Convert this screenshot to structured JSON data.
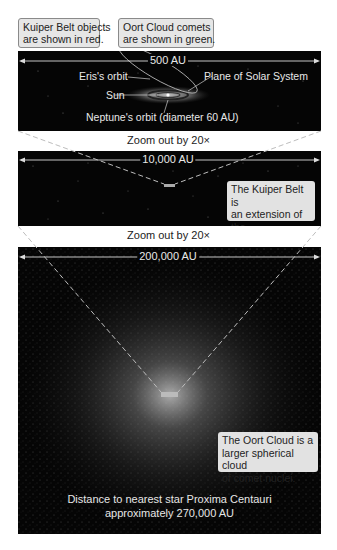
{
  "legend": {
    "kuiper_note": [
      "Kuiper Belt objects",
      "are shown in red."
    ],
    "oort_note": [
      "Oort Cloud comets",
      "are shown in green."
    ]
  },
  "panel1": {
    "scale": "500 AU",
    "labels": {
      "eris": "Eris's orbit",
      "plane": "Plane of Solar System",
      "sun": "Sun",
      "neptune": "Neptune's orbit (diameter 60 AU)"
    }
  },
  "zoom1": {
    "caption": "Zoom out by 20×"
  },
  "panel2": {
    "scale": "10,000 AU",
    "note": [
      "The Kuiper Belt is",
      "an extension of the",
      "Solar System disk."
    ]
  },
  "zoom2": {
    "caption": "Zoom out by 20×"
  },
  "panel3": {
    "scale": "200,000 AU",
    "note": [
      "The Oort Cloud is a",
      "larger spherical cloud",
      "of comet nuclei."
    ],
    "footer": [
      "Distance to nearest star Proxima Centauri",
      "approximately 270,000 AU"
    ]
  },
  "colors": {
    "panel_bg": "#050505",
    "label_bg": "#e6e6e6",
    "line": "#d8d8d8"
  }
}
